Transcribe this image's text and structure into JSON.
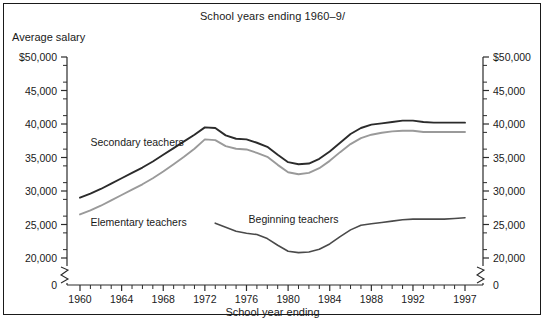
{
  "chart_data": {
    "type": "line",
    "title": "School years ending 1960–9/",
    "xlabel": "School year ending",
    "ylabel": "Average salary",
    "ylim": [
      18500,
      50000
    ],
    "xlim": [
      1959,
      1998
    ],
    "grid": false,
    "legend_position": "inline-annotations",
    "axis_break": true,
    "axis_break_label": "0",
    "yticks": [
      {
        "value": 50000,
        "label": "$50,000"
      },
      {
        "value": 45000,
        "label": "45,000"
      },
      {
        "value": 40000,
        "label": "40,000"
      },
      {
        "value": 35000,
        "label": "35,000"
      },
      {
        "value": 30000,
        "label": "30,000"
      },
      {
        "value": 25000,
        "label": "25,000"
      },
      {
        "value": 20000,
        "label": "20,000"
      }
    ],
    "yticks_right": [
      {
        "value": 50000,
        "label": "$50,000"
      },
      {
        "value": 45000,
        "label": "45,000"
      },
      {
        "value": 40000,
        "label": "40,000"
      },
      {
        "value": 35000,
        "label": "35,000"
      },
      {
        "value": 30000,
        "label": "30,000"
      },
      {
        "value": 25000,
        "label": "25,000"
      },
      {
        "value": 20000,
        "label": "20,000"
      }
    ],
    "yminor_step": 2500,
    "xticks_labeled": [
      1960,
      1964,
      1968,
      1972,
      1976,
      1980,
      1984,
      1988,
      1992,
      1997
    ],
    "xtick_labels": [
      "1960",
      "1964",
      "1968",
      "1972",
      "1976",
      "1980",
      "1984",
      "1988",
      "1992",
      "1997"
    ],
    "xticks_minor_step": 1,
    "series": [
      {
        "name": "Secondary teachers",
        "color": "#2b2b2b",
        "width": 1.9,
        "label_x": 1961.0,
        "label_y": 37200,
        "x": [
          1960,
          1961,
          1962,
          1963,
          1964,
          1965,
          1966,
          1967,
          1968,
          1969,
          1970,
          1971,
          1972,
          1973,
          1974,
          1975,
          1976,
          1977,
          1978,
          1979,
          1980,
          1981,
          1982,
          1983,
          1984,
          1985,
          1986,
          1987,
          1988,
          1989,
          1990,
          1991,
          1992,
          1993,
          1994,
          1995,
          1996,
          1997
        ],
        "values": [
          29000,
          29600,
          30300,
          31100,
          31900,
          32700,
          33500,
          34400,
          35400,
          36400,
          37400,
          38400,
          39500,
          39400,
          38300,
          37800,
          37700,
          37200,
          36600,
          35400,
          34300,
          34000,
          34100,
          34800,
          35900,
          37200,
          38500,
          39400,
          39900,
          40100,
          40300,
          40500,
          40500,
          40300,
          40200,
          40200,
          40200,
          40200
        ]
      },
      {
        "name": "Elementary teachers",
        "color": "#9a9a9a",
        "width": 1.9,
        "label_x": 1961.0,
        "label_y": 25200,
        "x": [
          1960,
          1961,
          1962,
          1963,
          1964,
          1965,
          1966,
          1967,
          1968,
          1969,
          1970,
          1971,
          1972,
          1973,
          1974,
          1975,
          1976,
          1977,
          1978,
          1979,
          1980,
          1981,
          1982,
          1983,
          1984,
          1985,
          1986,
          1987,
          1988,
          1989,
          1990,
          1991,
          1992,
          1993,
          1994,
          1995,
          1996,
          1997
        ],
        "values": [
          26500,
          27100,
          27800,
          28600,
          29400,
          30200,
          31000,
          31900,
          32900,
          34000,
          35100,
          36300,
          37700,
          37600,
          36700,
          36300,
          36200,
          35700,
          35100,
          33900,
          32800,
          32500,
          32700,
          33400,
          34500,
          35800,
          37000,
          37900,
          38400,
          38700,
          38900,
          39000,
          39000,
          38800,
          38800,
          38800,
          38800,
          38800
        ]
      },
      {
        "name": "Beginning teachers",
        "color": "#4a4a4a",
        "width": 1.6,
        "label_x": 1976.2,
        "label_y": 25600,
        "x": [
          1973,
          1974,
          1975,
          1976,
          1977,
          1978,
          1979,
          1980,
          1981,
          1982,
          1983,
          1984,
          1985,
          1986,
          1987,
          1988,
          1989,
          1990,
          1991,
          1992,
          1993,
          1994,
          1995,
          1996,
          1997
        ],
        "values": [
          25200,
          24600,
          24000,
          23700,
          23500,
          22900,
          21900,
          21000,
          20800,
          20900,
          21300,
          22100,
          23200,
          24200,
          24900,
          25100,
          25300,
          25500,
          25700,
          25800,
          25800,
          25800,
          25800,
          25900,
          26000
        ]
      }
    ]
  },
  "figure": {
    "title": "School years ending 1960–9/",
    "y_axis_title": "Average salary",
    "x_axis_title": "School year ending"
  }
}
